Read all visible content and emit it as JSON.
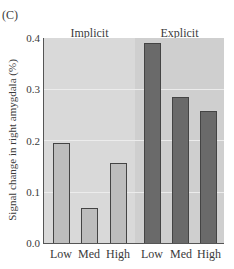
{
  "chart_data": {
    "type": "bar",
    "panel_label": "(C)",
    "title": "",
    "xlabel": "",
    "ylabel": "Signal change in right amygdala (%)",
    "ylim": [
      0,
      0.4
    ],
    "yticks": [
      "0.0",
      "0.1",
      "0.2",
      "0.3",
      "0.4"
    ],
    "grid": true,
    "groups": [
      {
        "name": "Implicit",
        "categories": [
          "Low",
          "Med",
          "High"
        ],
        "values": [
          0.195,
          0.068,
          0.157
        ],
        "bar_color": "#bdbdbd",
        "background": "#d9d9d9"
      },
      {
        "name": "Explicit",
        "categories": [
          "Low",
          "Med",
          "High"
        ],
        "values": [
          0.39,
          0.285,
          0.258
        ],
        "bar_color": "#6a6a6a",
        "background": "#cfcfcf"
      }
    ]
  }
}
